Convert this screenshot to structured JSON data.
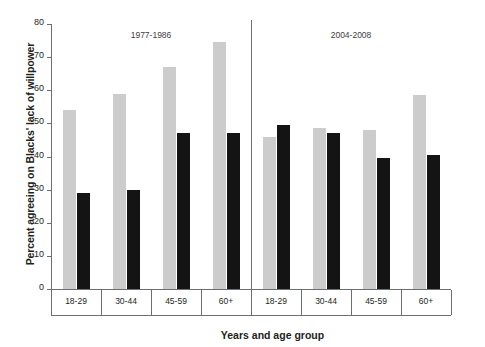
{
  "chart_data": {
    "type": "bar",
    "title": "",
    "xlabel": "Years and age group",
    "ylabel": "Percent agreeing on Blacks' lack of willpower",
    "ylim": [
      0,
      80
    ],
    "yticks": [
      0,
      10,
      20,
      30,
      40,
      50,
      60,
      70,
      80
    ],
    "grid": false,
    "legend": "none",
    "panels": [
      {
        "label": "1977-1986",
        "categories": [
          "18-29",
          "30-44",
          "45-59",
          "60+"
        ],
        "series": [
          {
            "name": "light",
            "color": "#cccccc",
            "values": [
              54,
              59,
              67,
              74.5
            ]
          },
          {
            "name": "dark",
            "color": "#141414",
            "values": [
              29,
              30,
              47,
              47
            ]
          }
        ]
      },
      {
        "label": "2004-2008",
        "categories": [
          "18-29",
          "30-44",
          "45-59",
          "60+"
        ],
        "series": [
          {
            "name": "light",
            "color": "#cccccc",
            "values": [
              46,
              48.5,
              48,
              58.5
            ]
          },
          {
            "name": "dark",
            "color": "#141414",
            "values": [
              49.5,
              47,
              39.5,
              40.5
            ]
          }
        ]
      }
    ]
  }
}
